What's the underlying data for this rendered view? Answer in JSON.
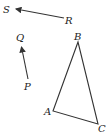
{
  "diagram": {
    "vectors": [
      {
        "name": "RS",
        "from_label": "R",
        "to_label": "S",
        "from": [
          64,
          18
        ],
        "to": [
          15,
          9
        ]
      },
      {
        "name": "PQ",
        "from_label": "P",
        "to_label": "Q",
        "from": [
          28,
          79
        ],
        "to": [
          21,
          46
        ]
      }
    ],
    "triangle": {
      "vertices": [
        {
          "label": "A",
          "x": 53,
          "y": 111
        },
        {
          "label": "B",
          "x": 78,
          "y": 42
        },
        {
          "label": "C",
          "x": 98,
          "y": 124
        }
      ]
    },
    "labels": {
      "S": "S",
      "R": "R",
      "Q": "Q",
      "P": "P",
      "A": "A",
      "B": "B",
      "C": "C"
    },
    "line_color": "#333333"
  }
}
